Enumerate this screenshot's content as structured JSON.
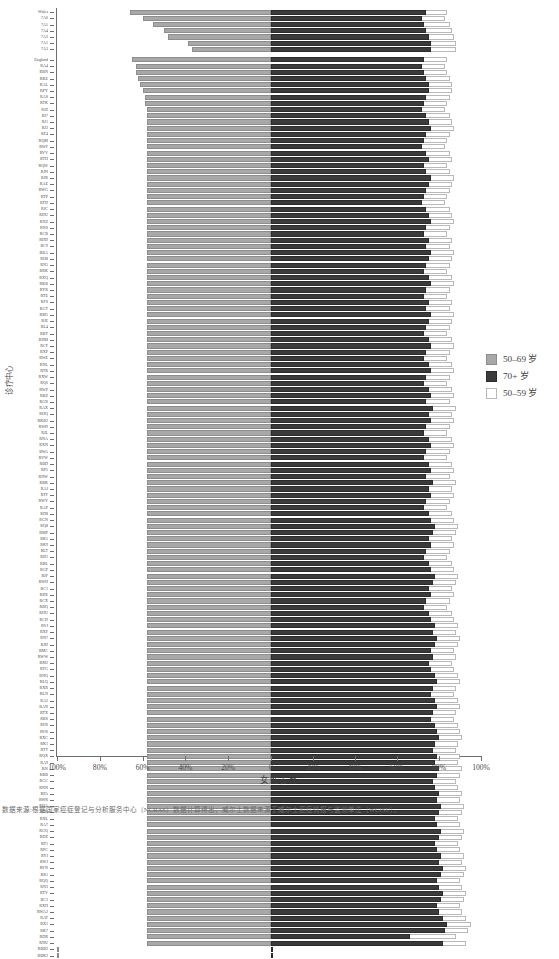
{
  "axes": {
    "y_title": "诊疗中心",
    "x_title": "女性占比",
    "x_tick_labels": [
      "100%",
      "80%",
      "60%",
      "40%",
      "20%",
      "0",
      "20%",
      "40%",
      "60%",
      "80%",
      "100%"
    ]
  },
  "legend": {
    "items": [
      {
        "label": "50–69 岁",
        "color": "#a8a8a8",
        "swatch": "s1"
      },
      {
        "label": "70+ 岁",
        "color": "#3b3b3b",
        "swatch": "s2"
      },
      {
        "label": "50–59 岁",
        "color": "#ffffff",
        "swatch": "s3"
      }
    ]
  },
  "caption": "数据来源:根据国家癌症登记与分析服务中心（NCRAS）数据计算得出；威尔士数据来源于威尔士癌症情报与监测单位（WCISU）。",
  "chart_data": {
    "type": "bar",
    "orientation": "horizontal",
    "subtype": "back-to-back population pyramid, left = 50–69 岁 (share of women), right = overlaid 70+ 岁 and 50–59 岁",
    "title": "",
    "xlabel": "女性占比",
    "ylabel": "诊疗中心",
    "xlim_left": [
      0,
      100
    ],
    "xlim_right": [
      0,
      100
    ],
    "xunit": "%",
    "grid": false,
    "legend_position": "right-middle",
    "series": [
      {
        "name": "50–69 岁",
        "side": "left",
        "color": "#a8a8a8"
      },
      {
        "name": "70+ 岁",
        "side": "right",
        "color": "#3b3b3b"
      },
      {
        "name": "50–59 岁",
        "side": "right",
        "color": "#ffffff"
      }
    ],
    "categories": [
      "Wales",
      "7A6",
      "7A5",
      "7A4",
      "7A2",
      "7A1",
      "7A3",
      "England",
      "RA4",
      "RBN",
      "RKE",
      "RAL",
      "RPY",
      "RAS",
      "RTK",
      "RJZ",
      "RJ7",
      "RJ1",
      "RJ2",
      "RF4",
      "RQM",
      "RWF",
      "RVV",
      "RTH",
      "RQW",
      "RJN",
      "RJR",
      "RAE",
      "RWG",
      "RTP",
      "RTD",
      "RJC",
      "RDU",
      "RNZ",
      "RNS",
      "RCB",
      "RDD",
      "RC9",
      "RBA",
      "RH8",
      "RN5",
      "RRK",
      "RXQ",
      "RKB",
      "RYR",
      "RTE",
      "RFS",
      "RGT",
      "RM1",
      "RJE",
      "RL4",
      "RBT",
      "RHM",
      "RCF",
      "RXP",
      "RWE",
      "RNL",
      "RTR",
      "RXW",
      "RQ6",
      "RWP",
      "RBZ",
      "RGR",
      "RAX",
      "RHQ",
      "RKB2",
      "RWD",
      "RJL",
      "RNA",
      "RXN",
      "RWA",
      "RVW",
      "RBD",
      "RP5",
      "RHW",
      "RBK",
      "RAJ",
      "RTF",
      "RWY",
      "RAP",
      "RD8",
      "RGN",
      "RQ8",
      "RMP",
      "RK5",
      "RK9",
      "RLT",
      "RD1",
      "RBL",
      "RGP",
      "RJF",
      "RWH",
      "RC1",
      "RDE",
      "RCX",
      "RBQ",
      "RHU",
      "RCD",
      "RVJ",
      "RXF",
      "RN7",
      "RJD",
      "RMC",
      "RWW",
      "RM2",
      "RTG",
      "RNQ",
      "RLQ",
      "RXR",
      "RLN",
      "RA2",
      "RAN",
      "RTX",
      "RBS",
      "RFR",
      "RVR",
      "RXC",
      "RK1",
      "RTT",
      "RQX",
      "RA9",
      "RJ6",
      "RBB",
      "RGC",
      "RNN",
      "RPA",
      "RWR",
      "RHA",
      "RD3",
      "RXL",
      "RA7",
      "RGQ",
      "RDZ",
      "RT1",
      "RPC",
      "RYJ",
      "RWJ",
      "RVN",
      "RR1",
      "RQQ",
      "RN3",
      "RTV",
      "RC3",
      "RXH",
      "RWA2",
      "RAT",
      "RX1",
      "RK7",
      "RDR",
      "RNU",
      "RBB2",
      "RBK2"
    ],
    "values_left_50_69": [
      66,
      60,
      55,
      50,
      48,
      39,
      37,
      65,
      63,
      63,
      62,
      61,
      60,
      59,
      59,
      58,
      58,
      58,
      58,
      58,
      58,
      58,
      58,
      58,
      58,
      58,
      58,
      58,
      58,
      58,
      58,
      58,
      58,
      58,
      58,
      58,
      58,
      58,
      58,
      58,
      58,
      58,
      58,
      58,
      58,
      58,
      58,
      58,
      58,
      58,
      58,
      58,
      58,
      58,
      58,
      58,
      58,
      58,
      58,
      58,
      58,
      58,
      58,
      58,
      58,
      58,
      58,
      58,
      58,
      58,
      58,
      58,
      58,
      58,
      58,
      58,
      58,
      58,
      58,
      58,
      58,
      58,
      58,
      58,
      58,
      58,
      58,
      58,
      58,
      58,
      58,
      58,
      58,
      58,
      58,
      58,
      58,
      58,
      58,
      58,
      58,
      58,
      58,
      58,
      58,
      58,
      58,
      58,
      58,
      58,
      58,
      58,
      58,
      58,
      58,
      58,
      58,
      58,
      58,
      58,
      58,
      58,
      58,
      58,
      58,
      58,
      58,
      58,
      58,
      58,
      58,
      58,
      58,
      58,
      58,
      58,
      58,
      58,
      58,
      58,
      58,
      58,
      58,
      58,
      58,
      58,
      58,
      58,
      58,
      58
    ],
    "values_right_70plus": [
      74,
      72,
      73,
      74,
      75,
      76,
      76,
      73,
      72,
      73,
      74,
      75,
      75,
      74,
      73,
      72,
      74,
      75,
      76,
      74,
      73,
      72,
      74,
      75,
      73,
      74,
      76,
      75,
      74,
      73,
      72,
      74,
      75,
      76,
      74,
      73,
      75,
      74,
      76,
      75,
      74,
      73,
      75,
      76,
      74,
      73,
      75,
      74,
      76,
      75,
      74,
      73,
      75,
      76,
      74,
      73,
      75,
      76,
      74,
      73,
      75,
      76,
      74,
      77,
      75,
      76,
      74,
      73,
      75,
      76,
      74,
      73,
      75,
      76,
      74,
      77,
      75,
      76,
      74,
      73,
      75,
      76,
      78,
      77,
      75,
      76,
      74,
      73,
      75,
      76,
      78,
      77,
      75,
      76,
      74,
      73,
      75,
      76,
      78,
      77,
      79,
      78,
      76,
      77,
      75,
      76,
      78,
      79,
      77,
      76,
      78,
      79,
      77,
      76,
      78,
      79,
      80,
      78,
      77,
      79,
      78,
      80,
      79,
      77,
      78,
      80,
      79,
      81,
      80,
      78,
      79,
      81,
      80,
      78,
      79,
      81,
      80,
      82,
      81,
      79,
      80,
      82,
      81,
      79,
      80,
      82,
      84,
      83,
      66,
      82
    ],
    "values_right_50_59": [
      84,
      83,
      85,
      86,
      87,
      88,
      88,
      84,
      83,
      84,
      85,
      86,
      86,
      85,
      84,
      83,
      85,
      86,
      87,
      85,
      84,
      83,
      85,
      86,
      84,
      85,
      87,
      86,
      85,
      84,
      83,
      85,
      86,
      87,
      85,
      84,
      86,
      85,
      87,
      86,
      85,
      84,
      86,
      87,
      85,
      84,
      86,
      85,
      87,
      86,
      85,
      84,
      86,
      87,
      85,
      84,
      86,
      87,
      85,
      84,
      86,
      87,
      85,
      88,
      86,
      87,
      85,
      84,
      86,
      87,
      85,
      84,
      86,
      87,
      85,
      88,
      86,
      87,
      85,
      84,
      86,
      87,
      89,
      88,
      86,
      87,
      85,
      84,
      86,
      87,
      89,
      88,
      86,
      87,
      85,
      84,
      86,
      87,
      89,
      88,
      90,
      89,
      87,
      88,
      86,
      87,
      89,
      90,
      88,
      87,
      89,
      90,
      88,
      87,
      89,
      90,
      91,
      89,
      88,
      90,
      89,
      91,
      90,
      88,
      89,
      91,
      90,
      92,
      91,
      89,
      90,
      92,
      91,
      89,
      90,
      92,
      91,
      93,
      92,
      90,
      91,
      93,
      92,
      90,
      91,
      93,
      95,
      94,
      88,
      93
    ]
  }
}
